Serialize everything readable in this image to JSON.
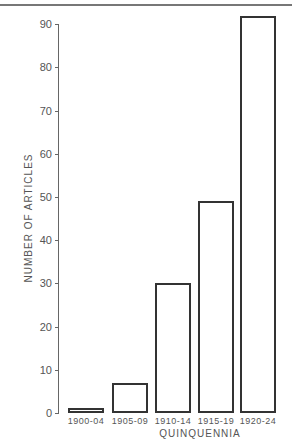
{
  "chart_data": {
    "type": "bar",
    "title": "",
    "xlabel": "QUINQUENNIA",
    "ylabel": "NUMBER OF ARTICLES",
    "categories": [
      "1900-04",
      "1905-09",
      "1910-14",
      "1915-19",
      "1920-24"
    ],
    "values": [
      1,
      7,
      30,
      49,
      92
    ],
    "ylim": [
      0,
      92
    ],
    "yticks": [
      0,
      10,
      20,
      30,
      40,
      50,
      60,
      70,
      80,
      90
    ],
    "grid": false,
    "legend": null
  },
  "labels": {
    "xlabel": "QUINQUENNIA",
    "ylabel": "NUMBER OF ARTICLES",
    "ticks": [
      "0",
      "10",
      "20",
      "30",
      "40",
      "50",
      "60",
      "70",
      "80",
      "90"
    ],
    "categories": [
      "1900-04",
      "1905-09",
      "1910-14",
      "1915-19",
      "1920-24"
    ]
  }
}
